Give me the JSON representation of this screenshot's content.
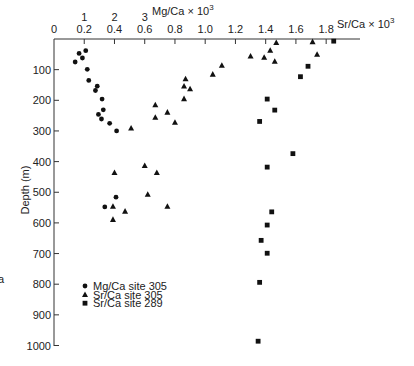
{
  "chart_data": {
    "type": "scatter",
    "title": "",
    "orientation": "depth profile (depth increases downward)",
    "axes": {
      "x_bottom_primary": {
        "label": "Sr/Ca × 10³",
        "label_base": "Sr/Ca × 10",
        "label_exp": "3",
        "ticks": [
          0,
          0.2,
          0.4,
          0.6,
          0.8,
          1.0,
          1.2,
          1.4,
          1.6,
          1.8
        ],
        "tick_labels": [
          "0",
          "0.2",
          "0.4",
          "0.6",
          "0.8",
          "1.0",
          "1.2",
          "1.4",
          "1.6",
          "1.8"
        ],
        "range": [
          0,
          1.9
        ],
        "position": "top"
      },
      "x_secondary": {
        "label": "Mg/Ca × 10³",
        "label_base": "Mg/Ca × 10",
        "label_exp": "3",
        "ticks": [
          1,
          2,
          3
        ],
        "tick_labels": [
          "1",
          "2",
          "3"
        ],
        "position": "top (above Sr/Ca labels)"
      },
      "y": {
        "label": "Depth (m)",
        "ticks": [
          100,
          200,
          300,
          400,
          500,
          600,
          700,
          800,
          900,
          1000
        ],
        "tick_labels": [
          "100",
          "200",
          "300",
          "400",
          "500",
          "600",
          "700",
          "800",
          "900",
          "1000"
        ],
        "range": [
          0,
          1000
        ],
        "inverted": true
      }
    },
    "grid": false,
    "legend_position": "lower-left inside plot",
    "series": [
      {
        "name": "Mg/Ca site 305",
        "marker": "circle",
        "axis": "Mg/Ca",
        "points": [
          {
            "x": 1.05,
            "depth": 38
          },
          {
            "x": 0.83,
            "depth": 47
          },
          {
            "x": 0.94,
            "depth": 62
          },
          {
            "x": 0.7,
            "depth": 75
          },
          {
            "x": 1.1,
            "depth": 99
          },
          {
            "x": 1.15,
            "depth": 135
          },
          {
            "x": 1.43,
            "depth": 154
          },
          {
            "x": 1.37,
            "depth": 168
          },
          {
            "x": 1.59,
            "depth": 196
          },
          {
            "x": 1.63,
            "depth": 231
          },
          {
            "x": 1.47,
            "depth": 246
          },
          {
            "x": 1.57,
            "depth": 261
          },
          {
            "x": 1.84,
            "depth": 275
          },
          {
            "x": 2.07,
            "depth": 300
          },
          {
            "x": 2.05,
            "depth": 516
          },
          {
            "x": 1.68,
            "depth": 548
          }
        ]
      },
      {
        "name": "Sr/Ca site 305",
        "marker": "triangle",
        "axis": "Sr/Ca",
        "points": [
          {
            "x": 1.47,
            "depth": 12
          },
          {
            "x": 1.71,
            "depth": 9
          },
          {
            "x": 1.43,
            "depth": 37
          },
          {
            "x": 1.74,
            "depth": 50
          },
          {
            "x": 1.3,
            "depth": 56
          },
          {
            "x": 1.39,
            "depth": 60
          },
          {
            "x": 1.46,
            "depth": 73
          },
          {
            "x": 1.11,
            "depth": 86
          },
          {
            "x": 1.05,
            "depth": 115
          },
          {
            "x": 0.87,
            "depth": 130
          },
          {
            "x": 0.86,
            "depth": 154
          },
          {
            "x": 0.9,
            "depth": 163
          },
          {
            "x": 0.86,
            "depth": 195
          },
          {
            "x": 0.67,
            "depth": 215
          },
          {
            "x": 0.75,
            "depth": 239
          },
          {
            "x": 0.67,
            "depth": 256
          },
          {
            "x": 0.8,
            "depth": 272
          },
          {
            "x": 0.51,
            "depth": 291
          },
          {
            "x": 0.6,
            "depth": 413
          },
          {
            "x": 0.4,
            "depth": 436
          },
          {
            "x": 0.68,
            "depth": 436
          },
          {
            "x": 0.62,
            "depth": 507
          },
          {
            "x": 0.39,
            "depth": 546
          },
          {
            "x": 0.75,
            "depth": 546
          },
          {
            "x": 0.47,
            "depth": 562
          },
          {
            "x": 0.39,
            "depth": 589
          }
        ]
      },
      {
        "name": "Sr/Ca site 289",
        "marker": "square",
        "axis": "Sr/Ca",
        "points": [
          {
            "x": 1.85,
            "depth": 7
          },
          {
            "x": 1.68,
            "depth": 89
          },
          {
            "x": 1.63,
            "depth": 123
          },
          {
            "x": 1.41,
            "depth": 196
          },
          {
            "x": 1.46,
            "depth": 232
          },
          {
            "x": 1.36,
            "depth": 269
          },
          {
            "x": 1.58,
            "depth": 374
          },
          {
            "x": 1.41,
            "depth": 418
          },
          {
            "x": 1.44,
            "depth": 564
          },
          {
            "x": 1.41,
            "depth": 607
          },
          {
            "x": 1.37,
            "depth": 657
          },
          {
            "x": 1.41,
            "depth": 699
          },
          {
            "x": 1.36,
            "depth": 794
          },
          {
            "x": 1.35,
            "depth": 986
          }
        ]
      }
    ]
  },
  "legend": {
    "items": [
      {
        "label": "Mg/Ca site 305",
        "marker": "circle"
      },
      {
        "label": "Sr/Ca site 305",
        "marker": "triangle"
      },
      {
        "label": "Sr/Ca site 289",
        "marker": "square"
      }
    ]
  },
  "labels": {
    "y_title": "Depth (m)",
    "sr_title": "Sr/Ca × 10",
    "mg_title": "Mg/Ca × 10",
    "exp": "3",
    "stray_glyph": "a"
  },
  "colors": {
    "ink": "#111111",
    "axis": "#333333",
    "background": "#ffffff"
  }
}
